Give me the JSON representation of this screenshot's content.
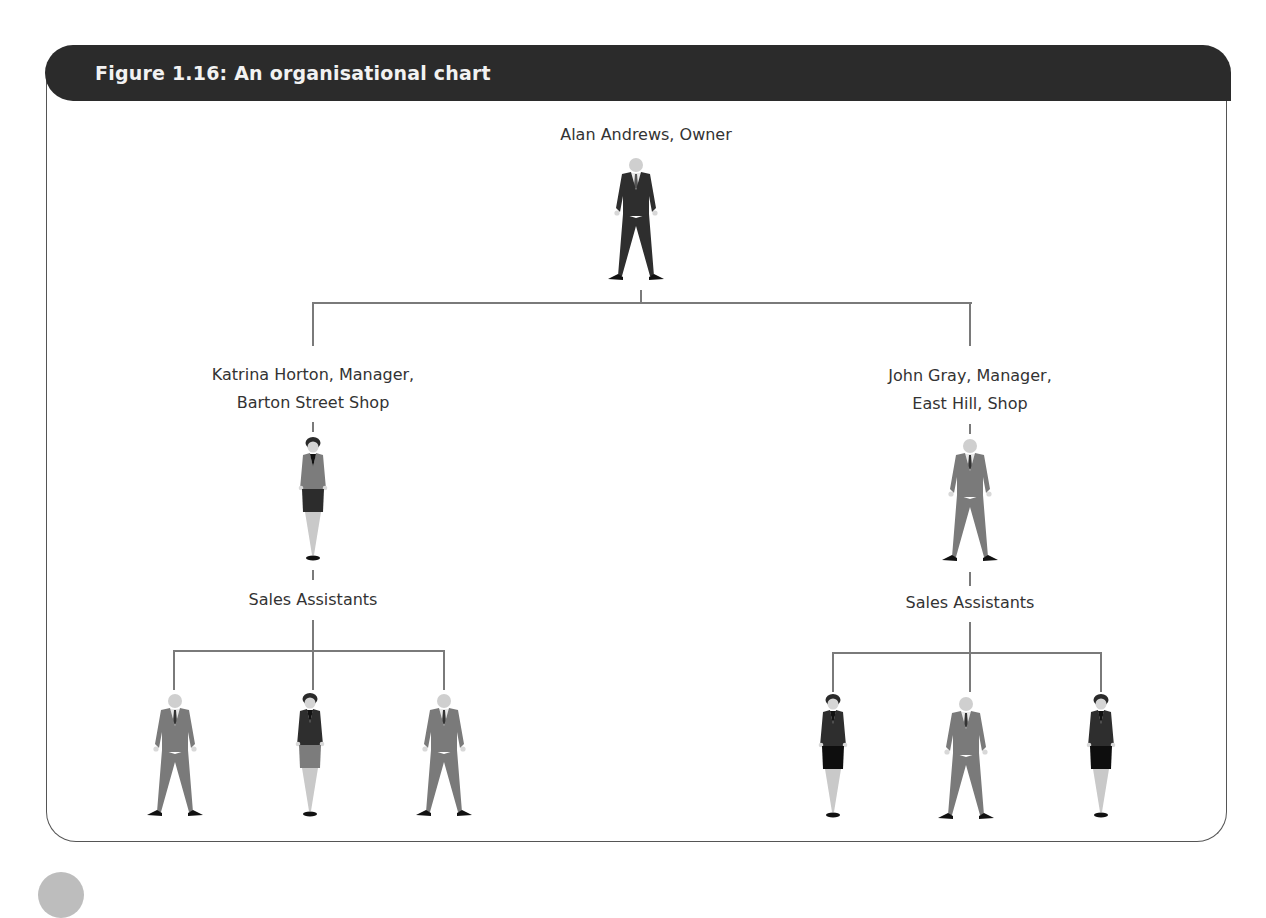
{
  "figure": {
    "title": "Figure 1.16: An organisational chart",
    "header_color": "#2b2b2b",
    "line_color": "#7a7a7a"
  },
  "org": {
    "owner": {
      "label": "Alan Andrews, Owner",
      "figure": "man-dark-suit"
    },
    "managers": [
      {
        "label_line1": "Katrina Horton, Manager,",
        "label_line2": "Barton Street Shop",
        "figure": "woman-gray-jacket",
        "team_label": "Sales Assistants",
        "staff": [
          "man-gray-suit",
          "woman-dark-jacket-gray-skirt",
          "man-gray-suit"
        ]
      },
      {
        "label_line1": "John Gray, Manager,",
        "label_line2": "East Hill, Shop",
        "figure": "man-gray-suit",
        "team_label": "Sales Assistants",
        "staff": [
          "woman-dark-jacket-black-skirt",
          "man-gray-suit",
          "woman-dark-jacket-black-skirt"
        ]
      }
    ]
  }
}
